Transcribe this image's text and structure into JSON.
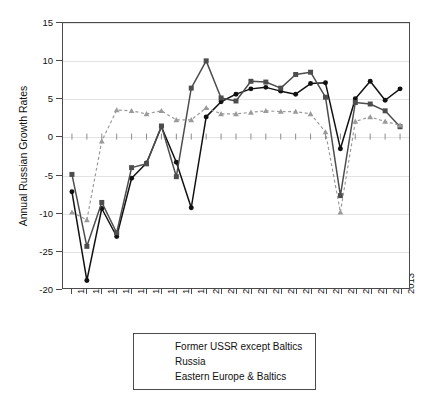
{
  "chart_data": {
    "type": "line",
    "title": "",
    "xlabel": "",
    "ylabel": "Annual Russian Growth Rates",
    "x": [
      1991,
      1992,
      1993,
      1994,
      1995,
      1996,
      1997,
      1998,
      1999,
      2000,
      2001,
      2002,
      2003,
      2004,
      2005,
      2006,
      2007,
      2008,
      2009,
      2010,
      2011,
      2012,
      2013
    ],
    "xticklabels": [
      "1991",
      "1992",
      "1993",
      "1994",
      "1995",
      "1996",
      "1997",
      "1998",
      "1999",
      "2000",
      "2001",
      "2002",
      "2003",
      "2004",
      "2005",
      "2006",
      "2007",
      "2008",
      "2009",
      "2010",
      "2011",
      "2012",
      "2013"
    ],
    "yticklabels": [
      "15",
      "10",
      "5",
      "0",
      "-5",
      "-10",
      "-25",
      "-20"
    ],
    "ytickvalues": [
      15,
      10,
      5,
      0,
      -5,
      -10,
      -15,
      -20
    ],
    "ylim": [
      -20,
      15
    ],
    "grid": true,
    "legend_position": "below-plot",
    "series": [
      {
        "name": "Former USSR except Baltics",
        "marker": "circle",
        "linestyle": "solid",
        "color": "#111111",
        "values": [
          -7.3,
          -19.0,
          -9.5,
          -13.2,
          -5.5,
          -3.5,
          1.3,
          -3.4,
          -9.4,
          2.6,
          4.6,
          5.6,
          6.3,
          6.5,
          6.0,
          5.6,
          7.0,
          7.1,
          -1.6,
          5.0,
          7.3,
          4.8,
          6.3
        ]
      },
      {
        "name": "Russia",
        "marker": "square",
        "linestyle": "solid",
        "color": "#4d4d4d",
        "values": [
          -5.0,
          -14.5,
          -8.7,
          -12.7,
          -4.1,
          -3.6,
          1.4,
          -5.3,
          6.4,
          10.0,
          5.1,
          4.7,
          7.3,
          7.2,
          6.4,
          8.2,
          8.5,
          5.2,
          -7.8,
          4.5,
          4.3,
          3.4,
          1.3
        ]
      },
      {
        "name": "Eastern Europe & Baltics",
        "marker": "triangle",
        "linestyle": "dashed",
        "color": "#9a9a9a",
        "values": [
          -10.0,
          -11.0,
          -0.6,
          3.5,
          3.4,
          3.0,
          3.4,
          2.2,
          2.2,
          3.8,
          3.0,
          3.0,
          3.2,
          3.4,
          3.3,
          3.3,
          3.0,
          0.6,
          -10.0,
          2.0,
          2.6,
          2.0,
          1.5
        ]
      }
    ]
  },
  "legend": {
    "items": [
      {
        "label": "Former USSR except Baltics"
      },
      {
        "label": "Russia"
      },
      {
        "label": "Eastern Europe & Baltics"
      }
    ]
  }
}
